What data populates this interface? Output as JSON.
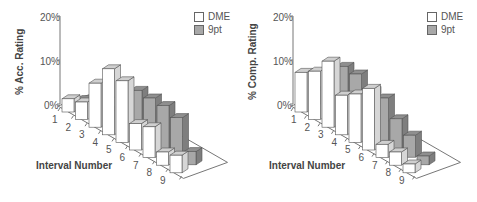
{
  "chart_data": [
    {
      "type": "bar",
      "subtype": "3d-grouped",
      "title": "",
      "ylabel": "% Acc. Rating",
      "xlabel": "Interval Number",
      "categories": [
        "1",
        "2",
        "3",
        "4",
        "5",
        "6",
        "7",
        "8",
        "9"
      ],
      "yticks": [
        "0%",
        "10%",
        "20%"
      ],
      "ylim": [
        0,
        20
      ],
      "legend": [
        "DME",
        "9pt"
      ],
      "legend_position": "top-right",
      "series": [
        {
          "name": "DME",
          "color": "#ffffff",
          "values": [
            3,
            4,
            10,
            15,
            14,
            6,
            7,
            3,
            4
          ]
        },
        {
          "name": "9pt",
          "color": "#a8a8a8",
          "values": [
            1,
            1,
            2,
            5,
            10,
            10,
            10,
            9,
            3
          ]
        }
      ]
    },
    {
      "type": "bar",
      "subtype": "3d-grouped",
      "title": "",
      "ylabel": "% Comp. Rating",
      "xlabel": "Interval Number",
      "categories": [
        "1",
        "2",
        "3",
        "4",
        "5",
        "6",
        "7",
        "8",
        "9"
      ],
      "yticks": [
        "0%",
        "10%",
        "20%"
      ],
      "ylim": [
        0,
        20
      ],
      "legend": [
        "DME",
        "9pt"
      ],
      "legend_position": "top-right",
      "series": [
        {
          "name": "DME",
          "color": "#ffffff",
          "values": [
            9,
            11,
            15,
            9,
            11,
            14,
            3,
            3,
            2
          ]
        },
        {
          "name": "9pt",
          "color": "#a8a8a8",
          "values": [
            3,
            6,
            12,
            12,
            10,
            10,
            7,
            5,
            2
          ]
        }
      ]
    }
  ],
  "panels": [
    {
      "ylabel": "% Acc. Rating",
      "xlabel": "Interval Number",
      "legend": [
        "DME",
        "9pt"
      ],
      "yticks": [
        "0%",
        "10%",
        "20%"
      ],
      "categories": [
        "1",
        "2",
        "3",
        "4",
        "5",
        "6",
        "7",
        "8",
        "9"
      ]
    },
    {
      "ylabel": "% Comp. Rating",
      "xlabel": "Interval Number",
      "legend": [
        "DME",
        "9pt"
      ],
      "yticks": [
        "0%",
        "10%",
        "20%"
      ],
      "categories": [
        "1",
        "2",
        "3",
        "4",
        "5",
        "6",
        "7",
        "8",
        "9"
      ]
    }
  ]
}
